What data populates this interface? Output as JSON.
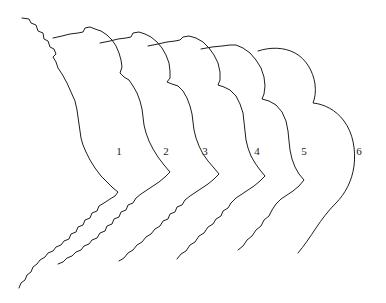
{
  "figure": {
    "background_color": "#ffffff",
    "stroke_color": "#1d1d1d",
    "stroke_width": 1,
    "width": 386,
    "height": 303
  },
  "stages": [
    {
      "id": "curve-1",
      "label": "1",
      "label_x": 119,
      "label_y": 152,
      "roughness": "very-jagged",
      "path": "M22,18 L29,19 L31,23 L36,25 L38,31 L43,33 L44,39 L48,41 L50,47 L54,49 L56,54 L53,57 L56,62 L58,68 L62,74 L67,83 L71,92 L75,101 L77,110 L78,117 L79,124 L80,131 L81,138 L83,145 L86,152 L90,160 L95,168 L101,176 L108,183 L113,188 L118,192 L115,196 L110,199 L104,203 L99,206 L97,211 L92,213 L90,218 L85,220 L83,225 L78,227 L76,232 L71,234 L69,239 L64,241 L61,245 L56,247 L53,251 L48,253 L45,257 L40,260 L37,264 L33,267 L31,272 L27,275 L25,280 L21,283 L19,288"
    },
    {
      "id": "curve-2",
      "label": "2",
      "label_x": 166,
      "label_y": 152,
      "roughness": "jagged",
      "path": "M53,38 L62,36 L70,34 L78,33 L83,32 L85,28 L90,27 L95,29 L101,31 L107,35 L112,40 L116,46 L119,53 L121,60 L122,67 L120,73 L124,77 L129,80 L133,86 L137,93 L140,101 L142,109 L143,117 L144,125 L146,133 L149,141 L153,149 L158,157 L164,165 L170,172 L165,177 L159,182 L153,186 L147,190 L141,194 L136,198 L133,203 L128,205 L126,210 L121,212 L119,217 L114,219 L112,224 L107,226 L105,231 L100,233 L97,238 L92,240 L89,244 L84,246 L81,250 L76,252 L72,256 L67,258 L63,262 L58,264"
    },
    {
      "id": "curve-3",
      "label": "3",
      "label_x": 205,
      "label_y": 152,
      "roughness": "medium-jagged",
      "path": "M100,43 L110,41 L118,39 L126,38 L131,37 L133,33 L139,32 L145,34 L151,37 L157,42 L162,48 L166,55 L169,63 L170,71 L170,78 L167,82 L172,84 L178,86 L183,91 L187,98 L190,106 L192,114 L193,122 L194,130 L196,138 L199,146 L203,154 L208,161 L214,168 L219,174 L214,179 L208,184 L202,188 L196,192 L190,196 L185,200 L182,205 L177,207 L175,212 L170,214 L168,219 L163,221 L160,226 L155,229 L151,234 L146,237 L142,242 L137,245 L133,250 L128,253 L124,258 L119,261"
    },
    {
      "id": "curve-4",
      "label": "4",
      "label_x": 257,
      "label_y": 152,
      "roughness": "slightly-jagged",
      "path": "M148,46 L158,44 L167,42 L175,41 L180,40 L183,37 L189,36 L196,38 L203,42 L209,48 L214,55 L218,63 L220,72 L220,80 L218,85 L224,87 L230,90 L236,96 L240,104 L243,113 L244,122 L245,131 L246,140 L248,148 L251,156 L255,163 L260,170 L265,176 L260,181 L254,186 L248,190 L242,194 L236,198 L231,203 L228,208 L223,211 L221,216 L216,219 L213,224 L208,227 L204,233 L199,236 L195,242 L190,245 L186,251 L181,254 L177,259"
    },
    {
      "id": "curve-5",
      "label": "5",
      "label_x": 304,
      "label_y": 152,
      "roughness": "nearly-smooth",
      "path": "M201,49 L212,47 L222,46 L230,45 L236,45 L243,48 L250,53 L256,60 L261,68 L264,77 L265,86 L264,94 L262,99 L269,101 L276,105 L282,112 L286,121 L288,131 L289,141 L290,150 L292,159 L295,167 L299,174 L304,180 L299,186 L293,191 L287,195 L281,199 L276,204 L272,210 L269,216 L264,220 L261,226 L256,230 L252,236 L247,240 L243,246 L238,250"
    },
    {
      "id": "curve-6",
      "label": "6",
      "label_x": 359,
      "label_y": 152,
      "roughness": "smooth",
      "path": "M258,51 C270,47 284,47 295,53 C306,59 313,71 315,84 C316,92 315,98 313,103 C324,104 336,110 344,121 C353,133 356,150 354,166 C352,181 345,194 336,203 C328,211 322,219 316,228 C310,237 304,246 298,253"
    }
  ],
  "legend": {
    "numbers": [
      "1",
      "2",
      "3",
      "4",
      "5",
      "6"
    ],
    "note": ""
  }
}
